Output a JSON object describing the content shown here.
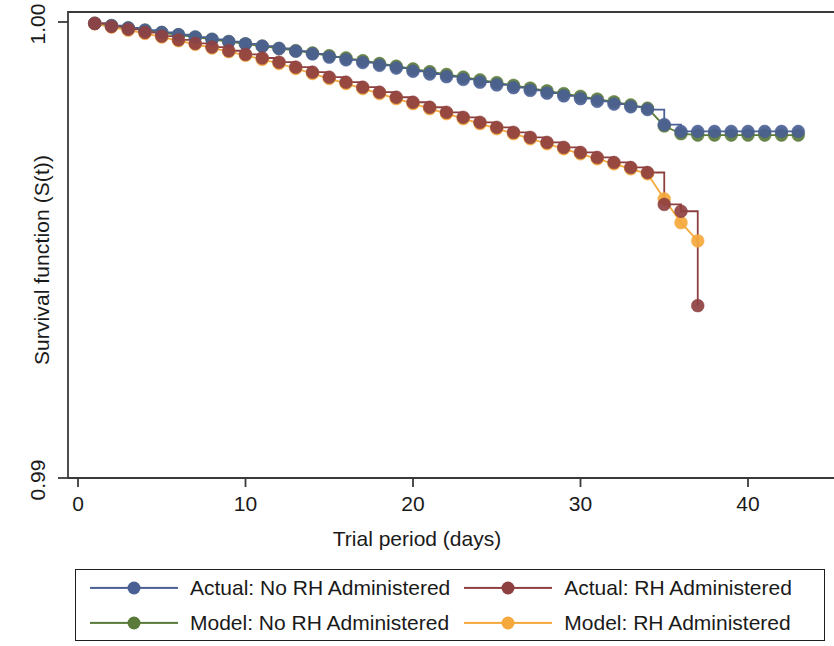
{
  "chart_data": {
    "type": "line",
    "title": "",
    "xlabel": "Trial period (days)",
    "ylabel": "Survival function (S(t))",
    "xlim": [
      0,
      44
    ],
    "ylim": [
      0.99,
      1.0
    ],
    "xticks": [
      0,
      10,
      20,
      30,
      40
    ],
    "xtick_labels": [
      "0",
      "10",
      "20",
      "30",
      "40"
    ],
    "yticks": [
      0.99,
      1.0
    ],
    "ytick_labels": [
      "0.99",
      "1.00"
    ],
    "grid": false,
    "legend_position": "below",
    "marker": "circle",
    "series": [
      {
        "name": "Actual: No RH Administered",
        "color": "#4a5f94",
        "style": "step",
        "x": [
          1,
          2,
          3,
          4,
          5,
          6,
          7,
          8,
          9,
          10,
          11,
          12,
          13,
          14,
          15,
          16,
          17,
          18,
          19,
          20,
          21,
          22,
          23,
          24,
          25,
          26,
          27,
          28,
          29,
          30,
          31,
          32,
          33,
          34,
          35,
          36,
          37,
          38,
          39,
          40,
          41,
          42,
          43
        ],
        "y": [
          0.99997,
          0.99992,
          0.99987,
          0.99982,
          0.99977,
          0.99972,
          0.99967,
          0.99962,
          0.99957,
          0.99952,
          0.99947,
          0.99942,
          0.99936,
          0.9993,
          0.99923,
          0.99917,
          0.99911,
          0.99905,
          0.99899,
          0.99892,
          0.99886,
          0.9988,
          0.99874,
          0.99868,
          0.99862,
          0.99856,
          0.9985,
          0.99844,
          0.99838,
          0.99832,
          0.99826,
          0.9982,
          0.99814,
          0.99808,
          0.99775,
          0.9976,
          0.9976,
          0.9976,
          0.9976,
          0.9976,
          0.9976,
          0.9976,
          0.9976
        ]
      },
      {
        "name": "Model: No RH Administered",
        "color": "#5a7a3a",
        "style": "line",
        "x": [
          1,
          2,
          3,
          4,
          5,
          6,
          7,
          8,
          9,
          10,
          11,
          12,
          13,
          14,
          15,
          16,
          17,
          18,
          19,
          20,
          21,
          22,
          23,
          24,
          25,
          26,
          27,
          28,
          29,
          30,
          31,
          32,
          33,
          34,
          35,
          36,
          37,
          38,
          39,
          40,
          41,
          42,
          43
        ],
        "y": [
          0.99997,
          0.99992,
          0.99987,
          0.99982,
          0.99977,
          0.99972,
          0.99967,
          0.99962,
          0.99957,
          0.99952,
          0.99947,
          0.99942,
          0.99937,
          0.99932,
          0.99926,
          0.99921,
          0.99915,
          0.99909,
          0.99903,
          0.99897,
          0.99891,
          0.99885,
          0.99879,
          0.99873,
          0.99867,
          0.99861,
          0.99855,
          0.99849,
          0.99843,
          0.99837,
          0.99831,
          0.99825,
          0.99818,
          0.99811,
          0.99772,
          0.99755,
          0.99752,
          0.99752,
          0.99752,
          0.99752,
          0.99752,
          0.99752,
          0.99752
        ]
      },
      {
        "name": "Actual: RH Administered",
        "color": "#8e4040",
        "style": "step",
        "x": [
          1,
          2,
          3,
          4,
          5,
          6,
          7,
          8,
          9,
          10,
          11,
          12,
          13,
          14,
          15,
          16,
          17,
          18,
          19,
          20,
          21,
          22,
          23,
          24,
          25,
          26,
          27,
          28,
          29,
          30,
          31,
          32,
          33,
          34,
          35,
          36,
          37
        ],
        "y": [
          0.99997,
          0.9999,
          0.99984,
          0.99977,
          0.99969,
          0.99961,
          0.99953,
          0.99945,
          0.99937,
          0.99929,
          0.99921,
          0.99912,
          0.99901,
          0.9989,
          0.99879,
          0.99868,
          0.99857,
          0.99846,
          0.99835,
          0.99824,
          0.99813,
          0.99802,
          0.99791,
          0.9978,
          0.99769,
          0.99758,
          0.99747,
          0.99736,
          0.99725,
          0.99714,
          0.99703,
          0.99692,
          0.99681,
          0.9967,
          0.996,
          0.99585,
          0.99378
        ]
      },
      {
        "name": "Model: RH Administered",
        "color": "#f5a93c",
        "style": "line",
        "x": [
          1,
          2,
          3,
          4,
          5,
          6,
          7,
          8,
          9,
          10,
          11,
          12,
          13,
          14,
          15,
          16,
          17,
          18,
          19,
          20,
          21,
          22,
          23,
          24,
          25,
          26,
          27,
          28,
          29,
          30,
          31,
          32,
          33,
          34,
          35,
          36,
          37
        ],
        "y": [
          0.99996,
          0.99989,
          0.99982,
          0.99975,
          0.99967,
          0.99959,
          0.99951,
          0.99943,
          0.99935,
          0.99927,
          0.99918,
          0.99909,
          0.99898,
          0.99887,
          0.99876,
          0.99865,
          0.99854,
          0.99843,
          0.99832,
          0.99821,
          0.9981,
          0.99799,
          0.99788,
          0.99777,
          0.99766,
          0.99755,
          0.99744,
          0.99733,
          0.99722,
          0.99711,
          0.997,
          0.99689,
          0.99678,
          0.99667,
          0.99612,
          0.9956,
          0.9952
        ]
      }
    ]
  },
  "legend": {
    "items": [
      {
        "label": "Actual: No RH Administered",
        "color": "#4a5f94"
      },
      {
        "label": "Actual: RH Administered",
        "color": "#8e4040"
      },
      {
        "label": "Model: No RH Administered",
        "color": "#5a7a3a"
      },
      {
        "label": "Model: RH Administered",
        "color": "#f5a93c"
      }
    ]
  },
  "axes": {
    "y_top_label": "1.00",
    "y_bottom_label": "0.99",
    "x_labels": [
      "0",
      "10",
      "20",
      "30",
      "40"
    ]
  }
}
